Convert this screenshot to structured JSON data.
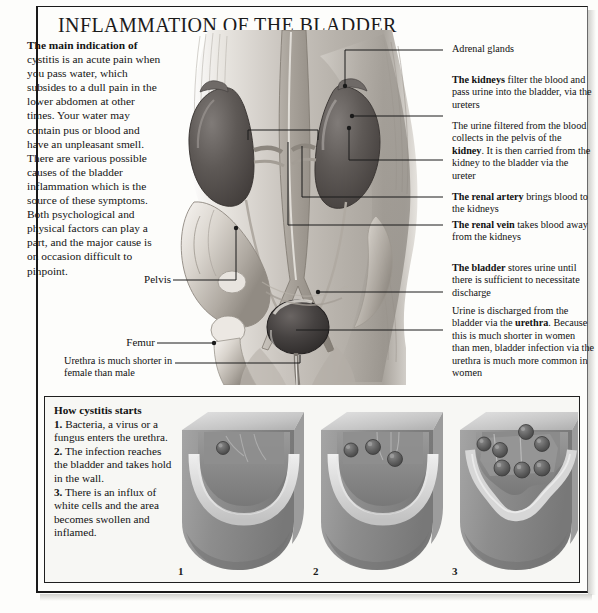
{
  "page": {
    "title": "INFLAMMATION OF THE BLADDER"
  },
  "intro": {
    "lead": "The main indication of",
    "body": "cystitis is an acute pain when you pass water, which subsides to a dull pain in the lower abdomen at other times. Your water may contain pus or blood and have an unpleasant smell. There are various possible causes of the bladder inflammation which is the source of these symptoms. Both psychological and physical factors can play a part, and the major cause is on occasion difficult to pinpoint."
  },
  "callouts": {
    "adrenal": {
      "plain": "Adrenal glands"
    },
    "kidneys": {
      "bold": "The kidneys",
      "rest": " filter the blood and pass urine into the bladder, via the ureters"
    },
    "urine_pelvis": {
      "pre": "The urine filtered from the blood collects in the pelvis of the ",
      "bold": "kidney",
      "post": ". It is then carried from the kidney to the bladder via the ureter"
    },
    "renal_artery": {
      "bold": "The renal artery",
      "rest": " brings blood to the kidneys"
    },
    "renal_vein": {
      "bold": "The renal vein",
      "rest": " takes blood away from the kidneys"
    },
    "bladder": {
      "bold": "The bladder",
      "rest": " stores urine until there is sufficient to necessitate discharge"
    },
    "urethra": {
      "pre": "Urine is discharged from the bladder via the ",
      "bold": "urethra",
      "post": ". Because this is much shorter in women than men, bladder infection via the urethra is much more common in women"
    }
  },
  "left_labels": {
    "pelvis": "Pelvis",
    "femur": "Femur",
    "urethra_note": "Urethra is much shorter in female than male"
  },
  "bottom_panel": {
    "title": "How cystitis starts",
    "steps": [
      {
        "num": "1.",
        "text": " Bacteria, a virus or a fungus enters the urethra."
      },
      {
        "num": "2.",
        "text": " The infection reaches the bladder and takes hold in the wall."
      },
      {
        "num": "3.",
        "text": " There is an influx of white cells and the area becomes swollen and inflamed."
      }
    ],
    "figure_numbers": [
      "1",
      "2",
      "3"
    ]
  },
  "colors": {
    "ink": "#111111",
    "page": "#fdfdfb",
    "panel_bg": "#f7f7f4",
    "frame": "#1a1a1a",
    "organ_dark": "#4e4a49",
    "organ_mid": "#6d6867",
    "tissue_light": "#dedad5",
    "tissue_mid": "#b8b3ad",
    "tissue_dark": "#8d8880",
    "model_face": "#8e8e8e",
    "model_top": "#cfcfcf",
    "model_rim": "#d9d9d9",
    "cell_dark": "#5b5b5b"
  }
}
